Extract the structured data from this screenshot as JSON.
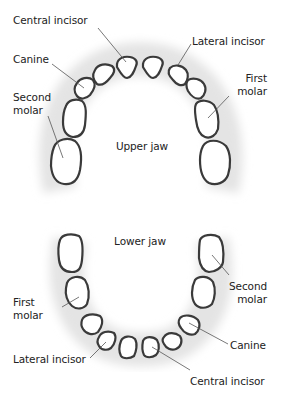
{
  "upper": {
    "title": "Upper jaw",
    "labels": {
      "central_incisor": "Central incisor",
      "lateral_incisor": "Lateral incisor",
      "canine": "Canine",
      "first_molar_1": "First",
      "first_molar_2": "molar",
      "second_molar_1": "Second",
      "second_molar_2": "molar"
    }
  },
  "lower": {
    "title": "Lower jaw",
    "labels": {
      "first_molar_1": "First",
      "first_molar_2": "molar",
      "second_molar_1": "Second",
      "second_molar_2": "molar",
      "canine": "Canine",
      "lateral_incisor": "Lateral incisor",
      "central_incisor": "Central incisor"
    }
  },
  "colors": {
    "tooth_outline": "#3a3a3a",
    "gum_shadow": "#e6e6e6",
    "leader_line": "#555555",
    "text": "#222222"
  }
}
